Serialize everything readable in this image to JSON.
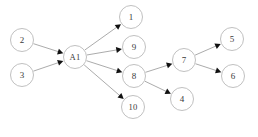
{
  "diagram": {
    "type": "directed-graph",
    "title": "",
    "background_color": "#ffffff",
    "node_fill_color": "#ffffff",
    "node_stroke_color": "#b9b9b9",
    "node_label_color": "#3a3a3a",
    "edge_color": "#9c9c9c",
    "arrow_color": "#111111",
    "node_radius": 11.5,
    "nodes": [
      {
        "id": "n2",
        "label": "2",
        "cx": 22,
        "cy": 40
      },
      {
        "id": "n3",
        "label": "3",
        "cx": 22,
        "cy": 75
      },
      {
        "id": "nA1",
        "label": "A1",
        "cx": 75,
        "cy": 57
      },
      {
        "id": "n1",
        "label": "1",
        "cx": 131,
        "cy": 17
      },
      {
        "id": "n9",
        "label": "9",
        "cx": 134,
        "cy": 47
      },
      {
        "id": "n8",
        "label": "8",
        "cx": 134,
        "cy": 76
      },
      {
        "id": "n10",
        "label": "10",
        "cx": 133,
        "cy": 107
      },
      {
        "id": "n7",
        "label": "7",
        "cx": 184,
        "cy": 60
      },
      {
        "id": "n5",
        "label": "5",
        "cx": 232,
        "cy": 39
      },
      {
        "id": "n6",
        "label": "6",
        "cx": 233,
        "cy": 76
      },
      {
        "id": "n4",
        "label": "4",
        "cx": 182,
        "cy": 99
      }
    ],
    "edges": [
      {
        "id": "e1",
        "from": "n2",
        "to": "nA1",
        "from_label": "2",
        "to_label": "A1"
      },
      {
        "id": "e2",
        "from": "n3",
        "to": "nA1",
        "from_label": "3",
        "to_label": "A1"
      },
      {
        "id": "e3",
        "from": "nA1",
        "to": "n1",
        "from_label": "A1",
        "to_label": "1"
      },
      {
        "id": "e4",
        "from": "nA1",
        "to": "n9",
        "from_label": "A1",
        "to_label": "9"
      },
      {
        "id": "e5",
        "from": "nA1",
        "to": "n8",
        "from_label": "A1",
        "to_label": "8"
      },
      {
        "id": "e6",
        "from": "nA1",
        "to": "n10",
        "from_label": "A1",
        "to_label": "10"
      },
      {
        "id": "e7",
        "from": "n8",
        "to": "n7",
        "from_label": "8",
        "to_label": "7"
      },
      {
        "id": "e8",
        "from": "n8",
        "to": "n4",
        "from_label": "8",
        "to_label": "4"
      },
      {
        "id": "e9",
        "from": "n7",
        "to": "n5",
        "from_label": "7",
        "to_label": "5"
      },
      {
        "id": "e10",
        "from": "n7",
        "to": "n6",
        "from_label": "7",
        "to_label": "6"
      }
    ]
  }
}
